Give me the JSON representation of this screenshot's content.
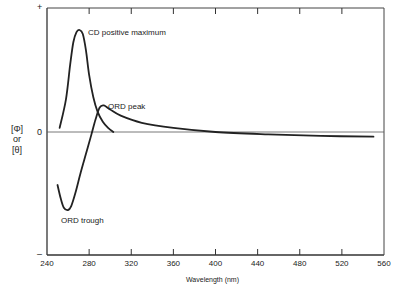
{
  "chart_data": {
    "type": "line",
    "title": "",
    "xlabel": "Wavelength (nm)",
    "ylabel": "[Φ] or [θ]",
    "ylabel_lines": [
      "[Φ]",
      "or",
      "[θ]"
    ],
    "xlim": [
      240,
      560
    ],
    "x_ticks": [
      240,
      280,
      320,
      360,
      400,
      440,
      480,
      520,
      560
    ],
    "x_tick_labels": [
      "240",
      "280",
      "320",
      "360",
      "400",
      "440",
      "480",
      "520",
      "560"
    ],
    "y_axis_marks": {
      "top": "+",
      "zero": "0",
      "bottom": "–"
    },
    "grid": false,
    "legend": null,
    "series": [
      {
        "name": "CD",
        "x": [
          252,
          258,
          262,
          265,
          268,
          271,
          274,
          277,
          280,
          284,
          288,
          293,
          298,
          303
        ],
        "y": [
          0.04,
          0.32,
          0.66,
          0.88,
          0.98,
          1.0,
          0.96,
          0.8,
          0.56,
          0.34,
          0.2,
          0.1,
          0.04,
          0.0
        ]
      },
      {
        "name": "ORD",
        "x": [
          250,
          253,
          256,
          260,
          263,
          267,
          272,
          277,
          282,
          286,
          290,
          294,
          300,
          310,
          330,
          360,
          400,
          450,
          500,
          550
        ],
        "y": [
          -0.68,
          -0.85,
          -0.97,
          -1.0,
          -0.95,
          -0.78,
          -0.52,
          -0.28,
          -0.04,
          0.12,
          0.24,
          0.26,
          0.22,
          0.16,
          0.09,
          0.04,
          0.0,
          -0.03,
          -0.05,
          -0.06
        ]
      }
    ],
    "annotations": [
      {
        "text": "CD positive maximum",
        "x": 272,
        "y": 1.0
      },
      {
        "text": "ORD peak",
        "x": 294,
        "y": 0.26
      },
      {
        "text": "ORD trough",
        "x": 260,
        "y": -1.0
      }
    ]
  },
  "labels": {
    "cd_max": "CD positive maximum",
    "ord_peak": "ORD peak",
    "ord_trough": "ORD trough",
    "xlabel": "Wavelength (nm)",
    "y_line1": "[Φ]",
    "y_line2": "or",
    "y_line3": "[θ]",
    "y_plus": "+",
    "y_zero": "0",
    "y_minus": "–"
  }
}
